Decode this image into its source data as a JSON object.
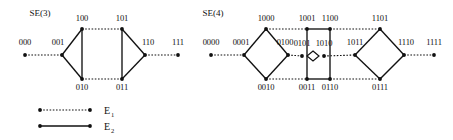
{
  "figure": {
    "background_color": "#ffffff",
    "ink_color": "#111111",
    "panels": [
      {
        "id": "se3",
        "title": "SE(3)",
        "title_pos": {
          "x": 40,
          "y": 16
        },
        "nodes": [
          {
            "id": "n000",
            "label": "000",
            "x": 25,
            "y": 55,
            "lx": 25,
            "ly": 45
          },
          {
            "id": "n001",
            "label": "001",
            "x": 62,
            "y": 55,
            "lx": 58,
            "ly": 45
          },
          {
            "id": "n100",
            "label": "100",
            "x": 82,
            "y": 29,
            "lx": 82,
            "ly": 21
          },
          {
            "id": "n101",
            "label": "101",
            "x": 122,
            "y": 29,
            "lx": 122,
            "ly": 21
          },
          {
            "id": "n010",
            "label": "010",
            "x": 82,
            "y": 79,
            "lx": 82,
            "ly": 90
          },
          {
            "id": "n011",
            "label": "011",
            "x": 122,
            "y": 79,
            "lx": 122,
            "ly": 90
          },
          {
            "id": "n110",
            "label": "110",
            "x": 145,
            "y": 55,
            "lx": 148,
            "ly": 45
          },
          {
            "id": "n111",
            "label": "111",
            "x": 178,
            "y": 55,
            "lx": 178,
            "ly": 45
          }
        ],
        "edges": [
          {
            "from": "n000",
            "to": "n001",
            "type": "E1"
          },
          {
            "from": "n100",
            "to": "n101",
            "type": "E1"
          },
          {
            "from": "n010",
            "to": "n011",
            "type": "E1"
          },
          {
            "from": "n110",
            "to": "n111",
            "type": "E1"
          },
          {
            "from": "n001",
            "to": "n100",
            "type": "E2"
          },
          {
            "from": "n001",
            "to": "n010",
            "type": "E2"
          },
          {
            "from": "n100",
            "to": "n010",
            "type": "E2"
          },
          {
            "from": "n101",
            "to": "n011",
            "type": "E2"
          },
          {
            "from": "n101",
            "to": "n110",
            "type": "E2"
          },
          {
            "from": "n011",
            "to": "n110",
            "type": "E2"
          }
        ]
      },
      {
        "id": "se4",
        "title": "SE(4)",
        "title_pos": {
          "x": 213,
          "y": 16
        },
        "nodes": [
          {
            "id": "m0000",
            "label": "0000",
            "x": 211,
            "y": 55,
            "lx": 211,
            "ly": 45
          },
          {
            "id": "m0001",
            "label": "0001",
            "x": 244,
            "y": 55,
            "lx": 241,
            "ly": 45
          },
          {
            "id": "m1000",
            "label": "1000",
            "x": 266,
            "y": 29,
            "lx": 266,
            "ly": 21
          },
          {
            "id": "m0010",
            "label": "0010",
            "x": 266,
            "y": 79,
            "lx": 266,
            "ly": 90
          },
          {
            "id": "m0100",
            "label": "0100",
            "x": 288,
            "y": 55,
            "lx": 285,
            "ly": 45
          },
          {
            "id": "m1001",
            "label": "1001",
            "x": 307,
            "y": 29,
            "lx": 307,
            "ly": 21
          },
          {
            "id": "m0011",
            "label": "0011",
            "x": 307,
            "y": 79,
            "lx": 307,
            "ly": 90
          },
          {
            "id": "m0101",
            "label": "0101",
            "x": 302,
            "y": 56,
            "lx": 302,
            "ly": 46
          },
          {
            "id": "m1010",
            "label": "1010",
            "x": 324,
            "y": 56,
            "lx": 324,
            "ly": 46
          },
          {
            "id": "m1100",
            "label": "1100",
            "x": 330,
            "y": 29,
            "lx": 330,
            "ly": 21
          },
          {
            "id": "m0110",
            "label": "0110",
            "x": 330,
            "y": 79,
            "lx": 330,
            "ly": 90
          },
          {
            "id": "m1011",
            "label": "1011",
            "x": 355,
            "y": 55,
            "lx": 355,
            "ly": 45
          },
          {
            "id": "m1101",
            "label": "1101",
            "x": 380,
            "y": 29,
            "lx": 380,
            "ly": 21
          },
          {
            "id": "m0111",
            "label": "0111",
            "x": 380,
            "y": 79,
            "lx": 380,
            "ly": 90
          },
          {
            "id": "m1110",
            "label": "1110",
            "x": 404,
            "y": 55,
            "lx": 406,
            "ly": 45
          },
          {
            "id": "m1111",
            "label": "1111",
            "x": 434,
            "y": 55,
            "lx": 434,
            "ly": 45
          }
        ],
        "edges": [
          {
            "from": "m0000",
            "to": "m0001",
            "type": "E1"
          },
          {
            "from": "m1000",
            "to": "m1001",
            "type": "E1"
          },
          {
            "from": "m0010",
            "to": "m0011",
            "type": "E1"
          },
          {
            "from": "m0100",
            "to": "m0101",
            "type": "E1"
          },
          {
            "from": "m1010",
            "to": "m1011",
            "type": "E1"
          },
          {
            "from": "m1100",
            "to": "m1101",
            "type": "E1"
          },
          {
            "from": "m0110",
            "to": "m0111",
            "type": "E1"
          },
          {
            "from": "m1110",
            "to": "m1111",
            "type": "E1"
          },
          {
            "from": "m0001",
            "to": "m1000",
            "type": "E2"
          },
          {
            "from": "m0001",
            "to": "m0010",
            "type": "E2"
          },
          {
            "from": "m1000",
            "to": "m0100",
            "type": "E2"
          },
          {
            "from": "m0010",
            "to": "m0100",
            "type": "E2"
          },
          {
            "from": "m1001",
            "to": "m1100",
            "type": "E2"
          },
          {
            "from": "m1001",
            "to": "m0011",
            "type": "E2"
          },
          {
            "from": "m0011",
            "to": "m0110",
            "type": "E2"
          },
          {
            "from": "m1100",
            "to": "m0110",
            "type": "E2"
          },
          {
            "from": "m1011",
            "to": "m1101",
            "type": "E2"
          },
          {
            "from": "m1011",
            "to": "m0111",
            "type": "E2"
          },
          {
            "from": "m1101",
            "to": "m1110",
            "type": "E2"
          },
          {
            "from": "m0111",
            "to": "m1110",
            "type": "E2"
          }
        ],
        "center_marker": {
          "cx": 313,
          "cy": 56,
          "rx": 6,
          "ry": 5
        }
      }
    ],
    "legend": {
      "items": [
        {
          "id": "legend-e1",
          "label": "E",
          "sub": "1",
          "type": "E1",
          "x1": 40,
          "x2": 90,
          "y": 110
        },
        {
          "id": "legend-e2",
          "label": "E",
          "sub": "2",
          "type": "E2",
          "x1": 40,
          "x2": 90,
          "y": 126
        }
      ]
    }
  }
}
